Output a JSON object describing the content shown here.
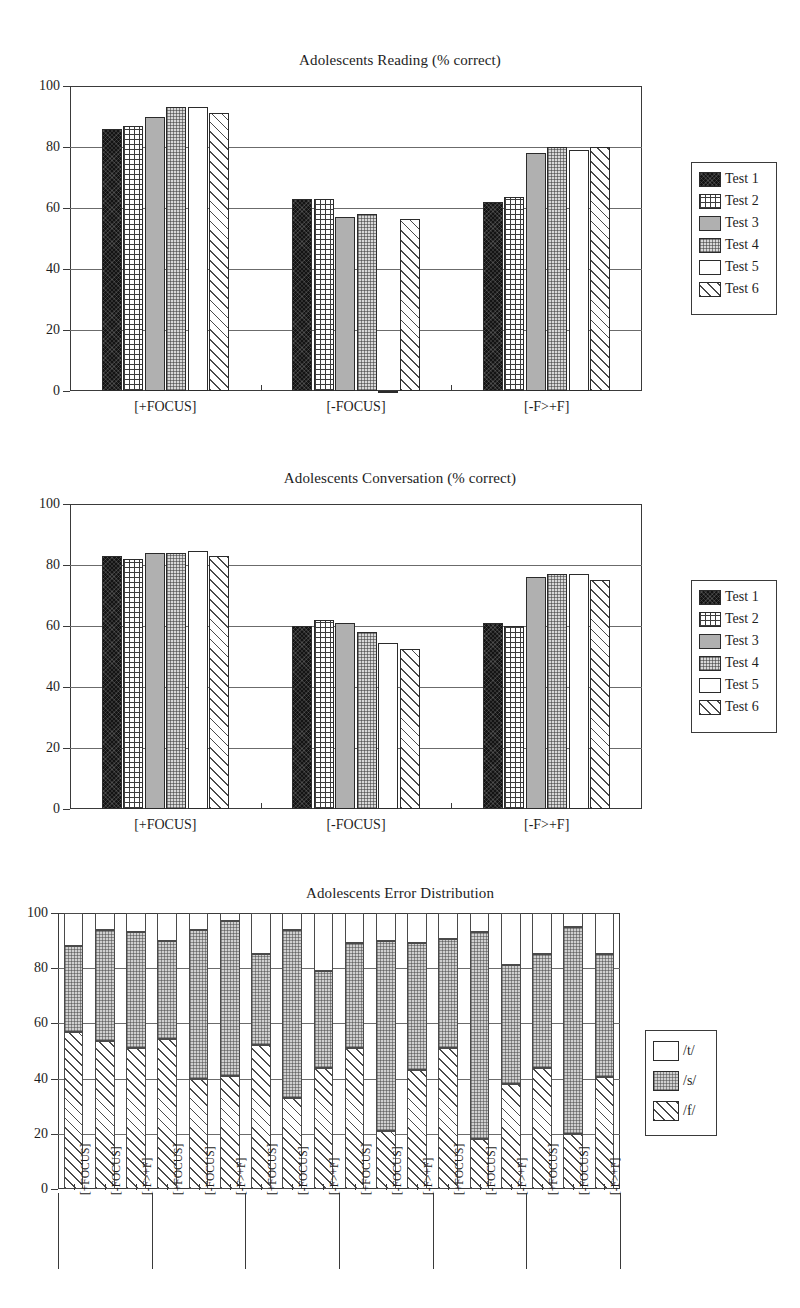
{
  "page": {
    "background": "#ffffff",
    "width": 800,
    "height": 1308
  },
  "charts": [
    {
      "id": "adolescents-reading",
      "title": "Adolescents Reading (% correct)",
      "legend_title": "",
      "axis": {
        "ymin": 0,
        "ymax": 100,
        "yticks": [
          0,
          20,
          40,
          60,
          80,
          100
        ]
      },
      "categories": [
        "[+FOCUS]",
        "[-FOCUS]",
        "[-F>+F]"
      ]
    },
    {
      "id": "adolescents-conversation",
      "title": "Adolescents Conversation (% correct)",
      "axis": {
        "ymin": 0,
        "ymax": 100,
        "yticks": [
          0,
          20,
          40,
          60,
          80,
          100
        ]
      },
      "categories": [
        "[+FOCUS]",
        "[-FOCUS]",
        "[-F>+F]"
      ]
    },
    {
      "id": "adolescents-error-distribution",
      "title": "Adolescents Error Distribution",
      "axis": {
        "ymin": 0,
        "ymax": 100,
        "yticks": [
          0,
          20,
          40,
          60,
          80,
          100
        ]
      }
    }
  ],
  "legend_tests": {
    "items": [
      {
        "label": "Test 1",
        "pattern": "solid-black"
      },
      {
        "label": "Test 2",
        "pattern": "grid"
      },
      {
        "label": "Test 3",
        "pattern": "gray"
      },
      {
        "label": "Test 4",
        "pattern": "dots"
      },
      {
        "label": "Test 5",
        "pattern": "white"
      },
      {
        "label": "Test 6",
        "pattern": "hatch"
      }
    ]
  },
  "legend_errors": {
    "items": [
      {
        "label": "/t/",
        "pattern": "white"
      },
      {
        "label": "/s/",
        "pattern": "dots-light"
      },
      {
        "label": "/f/",
        "pattern": "hatch"
      }
    ]
  },
  "chart_data": [
    {
      "type": "bar",
      "id": "adolescents-reading",
      "title": "Adolescents Reading (% correct)",
      "xlabel": "",
      "ylabel": "",
      "ylim": [
        0,
        100
      ],
      "yticks": [
        0,
        20,
        40,
        60,
        80,
        100
      ],
      "grid": true,
      "legend_position": "right",
      "categories": [
        "[+FOCUS]",
        "[-FOCUS]",
        "[-F>+F]"
      ],
      "series": [
        {
          "name": "Test 1",
          "pattern": "solid-black",
          "values": [
            86,
            63,
            62
          ]
        },
        {
          "name": "Test 2",
          "pattern": "grid",
          "values": [
            87,
            63,
            63.5
          ]
        },
        {
          "name": "Test 3",
          "pattern": "gray",
          "values": [
            90,
            57,
            78
          ]
        },
        {
          "name": "Test 4",
          "pattern": "dots",
          "values": [
            93,
            58,
            80
          ]
        },
        {
          "name": "Test 5",
          "pattern": "white",
          "values": [
            93,
            0,
            79
          ]
        },
        {
          "name": "Test 6",
          "pattern": "hatch",
          "values": [
            91,
            56.5,
            80
          ]
        }
      ]
    },
    {
      "type": "bar",
      "id": "adolescents-conversation",
      "title": "Adolescents Conversation (% correct)",
      "xlabel": "",
      "ylabel": "",
      "ylim": [
        0,
        100
      ],
      "yticks": [
        0,
        20,
        40,
        60,
        80,
        100
      ],
      "grid": true,
      "legend_position": "right",
      "categories": [
        "[+FOCUS]",
        "[-FOCUS]",
        "[-F>+F]"
      ],
      "series": [
        {
          "name": "Test 1",
          "pattern": "solid-black",
          "values": [
            83,
            60,
            61
          ]
        },
        {
          "name": "Test 2",
          "pattern": "grid",
          "values": [
            82,
            62,
            60
          ]
        },
        {
          "name": "Test 3",
          "pattern": "gray",
          "values": [
            84,
            61,
            76
          ]
        },
        {
          "name": "Test 4",
          "pattern": "dots",
          "values": [
            84,
            58,
            77
          ]
        },
        {
          "name": "Test 5",
          "pattern": "white",
          "values": [
            84.5,
            54.5,
            77
          ]
        },
        {
          "name": "Test 6",
          "pattern": "hatch",
          "values": [
            83,
            52.5,
            75
          ]
        }
      ]
    },
    {
      "type": "bar",
      "id": "adolescents-error-distribution",
      "subtype": "stacked",
      "title": "Adolescents Error Distribution",
      "xlabel": "",
      "ylabel": "",
      "ylim": [
        0,
        100
      ],
      "yticks": [
        0,
        20,
        40,
        60,
        80,
        100
      ],
      "grid": true,
      "legend_position": "right",
      "categories": [
        "[+FOCUS]",
        "[-FOCUS]",
        "[-F>+F]",
        "[+FOCUS]",
        "[-FOCUS]",
        "[-F>+F]",
        "[+FOCUS]",
        "[-FOCUS]",
        "[-F>+F]",
        "[+FOCUS]",
        "[-FOCUS]",
        "[-F>+F]",
        "[+FOCUS]",
        "[-FOCUS]",
        "[-F>+F]",
        "[+FOCUS]",
        "[-FOCUS]",
        "[-F>+F]"
      ],
      "series": [
        {
          "name": "/f/",
          "pattern": "hatch",
          "values": [
            57,
            53.5,
            51,
            54.5,
            40,
            41,
            52,
            33,
            44,
            51,
            21,
            43,
            51,
            18,
            38,
            44,
            20,
            40.5
          ]
        },
        {
          "name": "/s/",
          "pattern": "dots-light",
          "values": [
            31,
            40.5,
            42,
            35.5,
            54,
            56,
            33,
            61,
            35,
            38,
            69,
            46,
            39.5,
            75,
            43,
            41,
            75,
            44.5
          ]
        },
        {
          "name": "/t/",
          "pattern": "white",
          "values": [
            12,
            6,
            7,
            10,
            6,
            3,
            15,
            6,
            21,
            11,
            10,
            11,
            9.5,
            7,
            19,
            15,
            5,
            15
          ]
        }
      ],
      "cumulative_tops": {
        "f_top": [
          57,
          53.5,
          51,
          54.5,
          40,
          41,
          52,
          33,
          44,
          51,
          21,
          43,
          51,
          18,
          38,
          44,
          20,
          40.5
        ],
        "s_top": [
          88,
          94,
          93,
          90,
          94,
          97,
          85,
          94,
          79,
          89,
          90,
          89,
          90.5,
          93,
          81,
          85,
          95,
          85
        ]
      }
    }
  ]
}
